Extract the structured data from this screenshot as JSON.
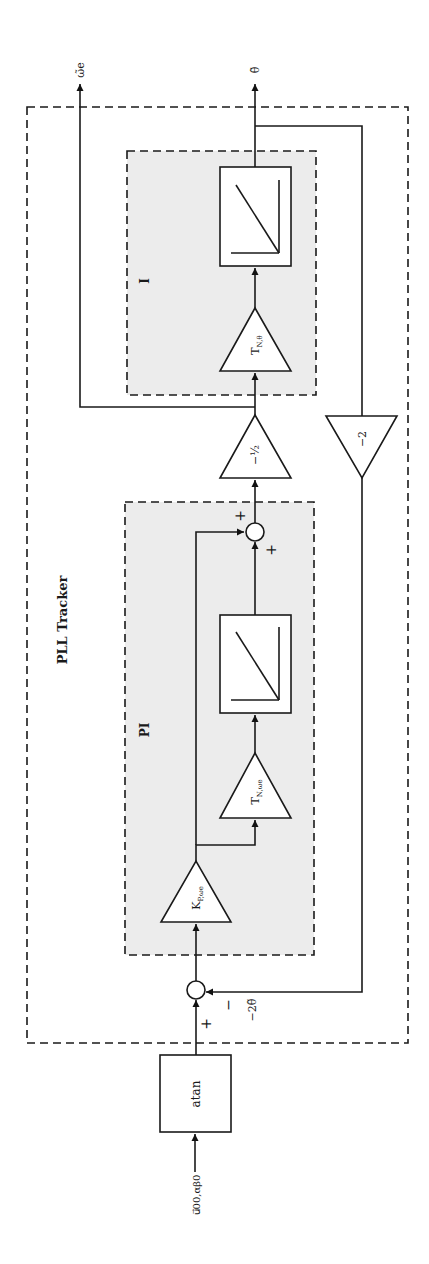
{
  "diagram": {
    "title": "PLL Tracker",
    "subsystems": {
      "pi": {
        "label": "PI"
      },
      "i": {
        "label": "I"
      }
    },
    "blocks": {
      "atan": {
        "label": "atan"
      },
      "kp": {
        "label": "K",
        "sub": "P,ωe"
      },
      "tn_omega": {
        "label": "T",
        "sub": "N,ωe"
      },
      "tn_theta": {
        "label": "T",
        "sub": "N,θ"
      },
      "half": {
        "label": "−½"
      },
      "minus2": {
        "label": "−2"
      }
    },
    "signals": {
      "input": "u⃗00,αβ0",
      "out_omega": "ω̃e",
      "out_theta": "θ̃",
      "feedback": "−2θ̃"
    },
    "sum_signs": {
      "sum1_plus": "+",
      "sum1_minus": "−",
      "sum2_plus_top": "+",
      "sum2_plus_bottom": "+"
    },
    "colors": {
      "line": "#1a1a1a",
      "shade": "#ececec",
      "background": "#ffffff"
    }
  }
}
